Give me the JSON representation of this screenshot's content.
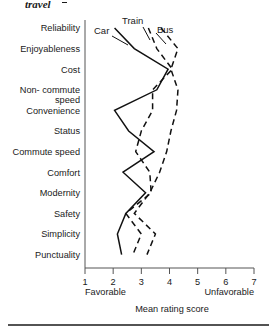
{
  "caption": {
    "tail_text": "travel",
    "has_trailing_dash": true
  },
  "chart_data": {
    "type": "line",
    "orientation": "horizontal",
    "title": "",
    "xlabel": "Mean rating score",
    "ylabel": "",
    "xlim": [
      1,
      7
    ],
    "xticks": [
      1,
      2,
      3,
      4,
      5,
      6,
      7
    ],
    "xtick_labels": [
      "1",
      "2",
      "3",
      "4",
      "5",
      "6",
      "7"
    ],
    "x_anchor_low": "Favorable",
    "x_anchor_high": "Unfavorable",
    "grid": false,
    "legend_position": "inline-annotations",
    "categories": [
      "Reliability",
      "Enjoyableness",
      "Cost",
      "Non- commute speed",
      "Convenience",
      "Status",
      "Commute speed",
      "Comfort",
      "Modernity",
      "Safety",
      "Simplicity",
      "Punctuality"
    ],
    "category_labels_wrapped": [
      [
        "Reliability"
      ],
      [
        "Enjoyableness"
      ],
      [
        "Cost"
      ],
      [
        "Non- commute",
        "speed"
      ],
      [
        "Convenience"
      ],
      [
        "Status"
      ],
      [
        "Commute speed"
      ],
      [
        "Comfort"
      ],
      [
        "Modernity"
      ],
      [
        "Safety"
      ],
      [
        "Simplicity"
      ],
      [
        "Punctuality"
      ]
    ],
    "series": [
      {
        "name": "Car",
        "style": "solid",
        "values": [
          2.05,
          2.75,
          3.95,
          3.55,
          2.05,
          2.55,
          3.45,
          2.35,
          3.15,
          2.45,
          2.15,
          2.3
        ]
      },
      {
        "name": "Train",
        "style": "dashed",
        "values": [
          3.25,
          3.55,
          4.1,
          3.4,
          3.4,
          3.0,
          2.8,
          3.3,
          3.35,
          2.45,
          3.0,
          2.7
        ]
      },
      {
        "name": "Bus",
        "style": "dashed",
        "values": [
          3.7,
          4.3,
          4.05,
          4.3,
          4.25,
          4.05,
          3.9,
          3.65,
          3.3,
          2.75,
          3.5,
          3.2
        ]
      }
    ],
    "annotations": [
      {
        "text": "Car",
        "points_to_series": "Car"
      },
      {
        "text": "Train",
        "points_to_series": "Train"
      },
      {
        "text": "Bus",
        "points_to_series": "Bus"
      }
    ]
  }
}
